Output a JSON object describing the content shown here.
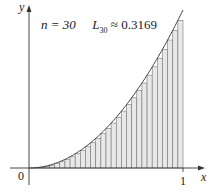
{
  "chart_data": {
    "type": "area",
    "title": "n = 30   L30 ≈ 0.3169",
    "function": "x^2",
    "method": "left endpoint Riemann sum",
    "n": 30,
    "approximation_label": "L30",
    "approximation_value": 0.3169,
    "xlabel": "x",
    "ylabel": "y",
    "x_ticks": [
      "0",
      "1"
    ],
    "xlim": [
      0,
      1
    ],
    "ylim": [
      0,
      1
    ],
    "grid": false,
    "legend": null
  },
  "annotation": {
    "n_label": "n = 30",
    "L_letter": "L",
    "L_subscript": "30",
    "approx_text": "≈ 0.3169"
  },
  "axes": {
    "x_label": "x",
    "y_label": "y",
    "origin_label": "0",
    "x_tick_1": "1"
  },
  "colors": {
    "axis": "#333333",
    "curve": "#444444",
    "rect_fill": "#e8e8e8",
    "rect_stroke": "#777777"
  }
}
